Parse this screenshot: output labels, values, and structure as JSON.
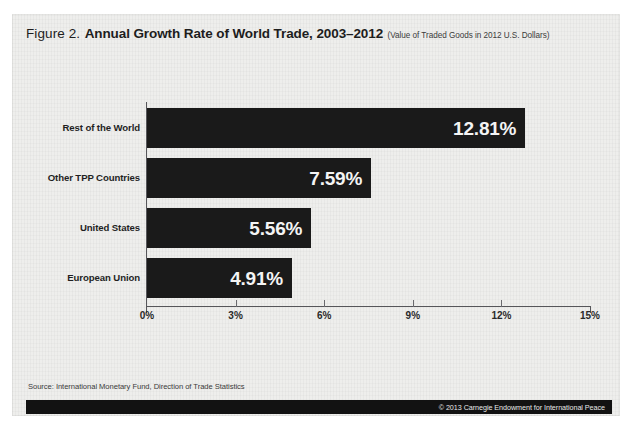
{
  "figure": {
    "label": "Figure 2.",
    "title": "Annual Growth Rate of World Trade, 2003–2012",
    "subtitle": "(Value of Traded Goods in 2012 U.S. Dollars)",
    "source_note": "Source: International Monetary Fund, Direction of Trade Statistics",
    "footer_credit": "© 2013 Carnegie Endowment for International Peace",
    "bar_color": "#1a1a1a",
    "value_text_color": "#f4f4f4",
    "panel_color": "#eeeeec",
    "axis_color": "#56565a"
  },
  "chart_data": {
    "type": "bar",
    "orientation": "horizontal",
    "title": "Annual Growth Rate of World Trade, 2003–2012",
    "subtitle": "(Value of Traded Goods in 2012 U.S. Dollars)",
    "xlabel": "",
    "ylabel": "",
    "xlim": [
      0,
      15
    ],
    "xticks": [
      0,
      3,
      6,
      9,
      12,
      15
    ],
    "xtick_labels": [
      "0%",
      "3%",
      "6%",
      "9%",
      "12%",
      "15%"
    ],
    "grid": false,
    "legend": "none",
    "categories": [
      "Rest of the World",
      "Other TPP Countries",
      "United States",
      "European Union"
    ],
    "values": [
      12.81,
      7.59,
      5.56,
      4.91
    ],
    "value_labels": [
      "12.81%",
      "7.59%",
      "5.56%",
      "4.91%"
    ]
  }
}
